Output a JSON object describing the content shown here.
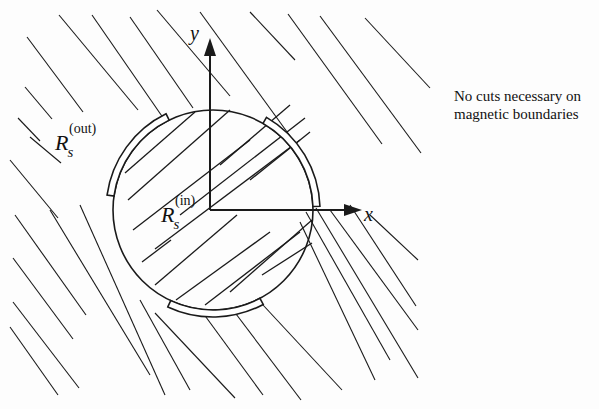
{
  "figure": {
    "width": 599,
    "height": 409,
    "stroke_color": "#1a1a1a",
    "background": "#fdfdfd"
  },
  "labels": {
    "axis_x": "x",
    "axis_y": "y",
    "region_outer": {
      "symbol": "R",
      "subscript": "s",
      "superscript": "(out)"
    },
    "region_inner": {
      "symbol": "R",
      "subscript": "s",
      "superscript": "(in)"
    },
    "note_line1": "No cuts necessary on",
    "note_line2": "magnetic boundaries"
  },
  "geometry": {
    "circle": {
      "cx": 213,
      "cy": 210,
      "r": 100
    },
    "origin": {
      "x": 210,
      "y": 210
    },
    "y_axis_top": 38,
    "x_axis_right": 362,
    "boundary_segments_deg": [
      {
        "start": 188,
        "end": 244
      },
      {
        "start": 300,
        "end": 358
      },
      {
        "start": 62,
        "end": 115
      }
    ],
    "outer_hatch": [
      [
        27,
        37,
        83,
        112
      ],
      [
        59,
        15,
        138,
        110
      ],
      [
        92,
        15,
        166,
        122
      ],
      [
        130,
        17,
        193,
        108
      ],
      [
        157,
        10,
        230,
        96
      ],
      [
        200,
        12,
        290,
        136
      ],
      [
        250,
        12,
        295,
        60
      ],
      [
        288,
        14,
        382,
        144
      ],
      [
        320,
        16,
        421,
        153
      ],
      [
        365,
        18,
        430,
        88
      ],
      [
        25,
        87,
        52,
        119
      ],
      [
        18,
        118,
        40,
        141
      ],
      [
        30,
        137,
        61,
        163
      ],
      [
        10,
        160,
        58,
        218
      ],
      [
        15,
        215,
        86,
        315
      ],
      [
        13,
        258,
        73,
        339
      ],
      [
        13,
        302,
        79,
        388
      ],
      [
        10,
        327,
        58,
        395
      ],
      [
        50,
        210,
        150,
        375
      ],
      [
        80,
        205,
        165,
        395
      ],
      [
        140,
        300,
        190,
        390
      ],
      [
        155,
        313,
        235,
        398
      ],
      [
        203,
        313,
        263,
        395
      ],
      [
        233,
        310,
        301,
        400
      ],
      [
        263,
        305,
        342,
        390
      ],
      [
        300,
        222,
        375,
        380
      ],
      [
        306,
        212,
        390,
        360
      ],
      [
        316,
        208,
        418,
        378
      ],
      [
        330,
        210,
        418,
        330
      ],
      [
        350,
        205,
        416,
        306
      ],
      [
        370,
        215,
        418,
        260
      ]
    ],
    "inner_hatch": [
      [
        125,
        173,
        195,
        112
      ],
      [
        128,
        200,
        230,
        110
      ],
      [
        133,
        230,
        250,
        140
      ],
      [
        155,
        249,
        300,
        140
      ],
      [
        180,
        215,
        305,
        118
      ],
      [
        142,
        262,
        171,
        240
      ],
      [
        155,
        285,
        237,
        215
      ],
      [
        176,
        300,
        270,
        232
      ],
      [
        205,
        305,
        300,
        232
      ],
      [
        230,
        292,
        312,
        220
      ],
      [
        262,
        275,
        312,
        243
      ],
      [
        220,
        165,
        290,
        105
      ],
      [
        250,
        180,
        310,
        132
      ]
    ]
  }
}
